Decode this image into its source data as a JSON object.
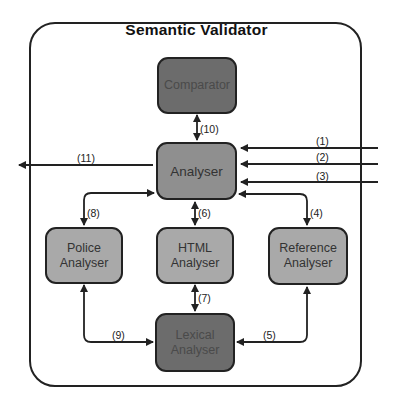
{
  "title": "Semantic Validator",
  "nodes": {
    "comparator": {
      "label": "Comparator"
    },
    "analyser": {
      "label": "Analyser"
    },
    "police": {
      "line1": "Police",
      "line2": "Analyser"
    },
    "html": {
      "line1": "HTML",
      "line2": "Analyser"
    },
    "reference": {
      "line1": "Reference",
      "line2": "Analyser"
    },
    "lexical": {
      "line1": "Lexical",
      "line2": "Analyser"
    }
  },
  "edges": {
    "e1": "(1)",
    "e2": "(2)",
    "e3": "(3)",
    "e4": "(4)",
    "e5": "(5)",
    "e6": "(6)",
    "e7": "(7)",
    "e8": "(8)",
    "e9": "(9)",
    "e10": "(10)",
    "e11": "(11)"
  },
  "colors": {
    "dark_node": "#6c6c6c",
    "mid_node": "#8f8f8f",
    "light_node": "#a9a9a9",
    "stroke": "#222222"
  }
}
